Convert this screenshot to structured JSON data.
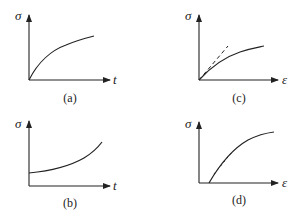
{
  "panels": [
    {
      "id": "a",
      "caption": "(a)",
      "y_label": "σ",
      "x_label": "t",
      "description": "stress vs time, concave-down rising from origin"
    },
    {
      "id": "b",
      "caption": "(b)",
      "y_label": "σ",
      "x_label": "t",
      "description": "stress vs time, concave-up rising from positive intercept"
    },
    {
      "id": "c",
      "caption": "(c)",
      "y_label": "σ",
      "x_label": "ε",
      "description": "stress vs strain, concave-down from origin with dashed initial tangent"
    },
    {
      "id": "d",
      "caption": "(d)",
      "y_label": "σ",
      "x_label": "ε",
      "description": "stress vs strain, concave-down starting at positive strain offset with dashed tangent"
    }
  ],
  "colors": {
    "line": "#222222",
    "background": "#ffffff"
  }
}
